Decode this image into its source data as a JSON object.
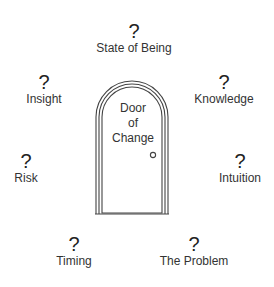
{
  "diagram": {
    "title": "Door of Change",
    "center": {
      "lines": [
        "Door",
        "of",
        "Change"
      ]
    },
    "nodes": [
      {
        "id": "state-of-being",
        "symbol": "?",
        "label": "State of Being"
      },
      {
        "id": "knowledge",
        "symbol": "?",
        "label": "Knowledge"
      },
      {
        "id": "intuition",
        "symbol": "?",
        "label": "Intuition"
      },
      {
        "id": "the-problem",
        "symbol": "?",
        "label": "The Problem"
      },
      {
        "id": "timing",
        "symbol": "?",
        "label": "Timing"
      },
      {
        "id": "risk",
        "symbol": "?",
        "label": "Risk"
      },
      {
        "id": "insight",
        "symbol": "?",
        "label": "Insight"
      }
    ]
  }
}
